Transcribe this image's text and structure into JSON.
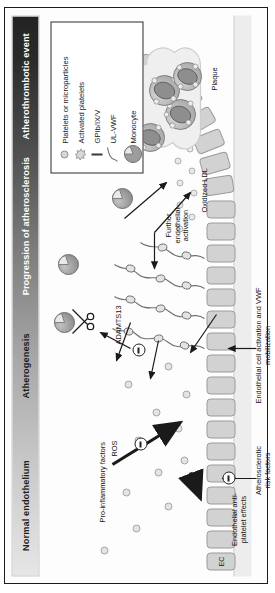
{
  "figure": {
    "orientation": "rotated-90-ccw"
  },
  "stage_bar": {
    "name": "disease-progression-gradient-bar",
    "stages": [
      {
        "label": "Normal endothelium",
        "text_color": "#1c1c1c"
      },
      {
        "label": "Atherogenesis",
        "text_color": "#1c1c1c"
      },
      {
        "label": "Progression of atherosclerosis",
        "text_color": "#ffffff"
      },
      {
        "label": "Atherothrombotic event",
        "text_color": "#ffffff"
      }
    ],
    "gradient_from": "#e6e6e6",
    "gradient_to": "#232323"
  },
  "legend": {
    "items": [
      {
        "symbol": "platelet-dot-icon",
        "label": "Platelets or microparticles"
      },
      {
        "symbol": "activated-platelet-star-icon",
        "label": "Activated platelets"
      },
      {
        "symbol": "gpib-receptor-bar-icon",
        "label": "GPIb/IX/V"
      },
      {
        "symbol": "ul-vwf-strand-icon",
        "label": "UL-VWF"
      },
      {
        "symbol": "monocyte-cell-icon",
        "label": "Monocyte"
      }
    ]
  },
  "labels": {
    "ec": "EC",
    "endothelial_antiplatelet": "Endothelial anti-platelet effects",
    "risk_factors": "Atherosclerotic risk factors",
    "pro_inflammatory": "Pro-inflammatory factors",
    "ros": "ROS",
    "ec_activation": "Endothelial cell activation and VWF mobilization",
    "adamts13": "ADAMTS13",
    "further_activation": "Further endothelial activation",
    "oxidized_ldl": "Oxidized LDL",
    "foam_cell": "Foam cell",
    "plaque": "Plaque"
  },
  "colors": {
    "endothelial_cell": "#d2d2d2",
    "plaque_fill": "#efefef",
    "foam_cell": "#b9b9b9",
    "monocyte": "#9d9d9d",
    "platelet": "#e4e4e4",
    "stroke": "#2a2a2a"
  }
}
